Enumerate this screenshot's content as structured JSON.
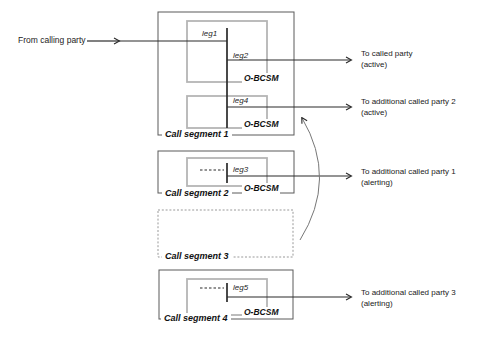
{
  "figure_type": "call-segment-diagram",
  "source": {
    "label": "From calling party"
  },
  "call_segments": [
    {
      "label": "Call segment 1",
      "legs": [
        {
          "label": "leg1"
        },
        {
          "label": "leg2"
        },
        {
          "label": "leg4"
        }
      ],
      "bcsm": [
        {
          "label": "O-BCSM"
        },
        {
          "label": "O-BCSM"
        }
      ]
    },
    {
      "label": "Call segment 2",
      "legs": [
        {
          "label": "leg3"
        }
      ],
      "bcsm": [
        {
          "label": "O-BCSM"
        }
      ]
    },
    {
      "label": "Call segment 3",
      "legs": [],
      "bcsm": []
    },
    {
      "label": "Call segment 4",
      "legs": [
        {
          "label": "leg5"
        }
      ],
      "bcsm": [
        {
          "label": "O-BCSM"
        }
      ]
    }
  ],
  "destinations": [
    {
      "line1": "To called party",
      "line2": "(active)"
    },
    {
      "line1": "To additional called party 2",
      "line2": "(active)"
    },
    {
      "line1": "To additional called party 1",
      "line2": "(alerting)"
    },
    {
      "line1": "To additional called party 3",
      "line2": "(alerting)"
    }
  ],
  "colors": {
    "line": "#2a2a2a",
    "outer_box_border": "#5a5a5a",
    "inner_box_border": "#b5b5b5",
    "dashed_box_border": "#999999",
    "background": "#ffffff",
    "text": "#1a1a1a"
  }
}
